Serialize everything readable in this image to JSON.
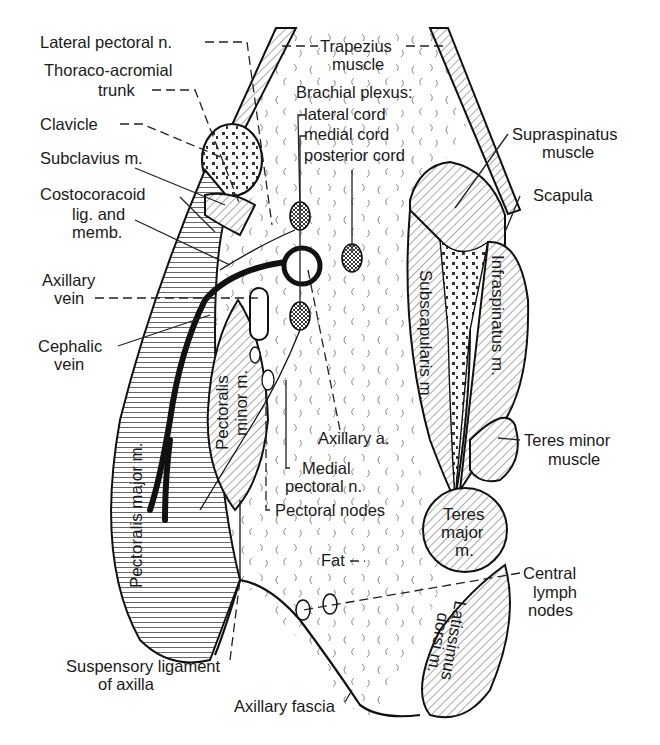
{
  "figure": {
    "left_labels": {
      "lateral_pectoral_n": "Lateral pectoral n.",
      "thoraco_acromial_1": "Thoraco-acromial",
      "thoraco_acromial_2": "trunk",
      "clavicle": "Clavicle",
      "subclavius": "Subclavius m.",
      "costocoracoid_1": "Costocoracoid",
      "costocoracoid_2": "lig. and",
      "costocoracoid_3": "memb.",
      "axillary_vein_1": "Axillary",
      "axillary_vein_2": "vein",
      "cephalic_vein_1": "Cephalic",
      "cephalic_vein_2": "vein"
    },
    "top_labels": {
      "trapezius_1": "Trapezius",
      "trapezius_2": "muscle",
      "brachial_plexus": "Brachial plexus:",
      "lateral_cord": "lateral cord",
      "medial_cord": "medial cord",
      "posterior_cord": "posterior cord"
    },
    "right_labels": {
      "supraspinatus_1": "Supraspinatus",
      "supraspinatus_2": "muscle",
      "scapula": "Scapula",
      "teres_minor_1": "Teres minor",
      "teres_minor_2": "muscle",
      "central_lymph_1": "Central",
      "central_lymph_2": "lymph",
      "central_lymph_3": "nodes"
    },
    "center_labels": {
      "axillary_a": "Axillary a.",
      "medial_pectoral_1": "Medial",
      "medial_pectoral_2": "pectoral n.",
      "pectoral_nodes": "Pectoral nodes",
      "fat": "Fat"
    },
    "bottom_labels": {
      "suspensory_1": "Suspensory ligament",
      "suspensory_2": "of axilla",
      "axillary_fascia": "Axillary fascia"
    },
    "inside_labels": {
      "pectoralis_major": "Pectoralis major m.",
      "pectoralis_minor_1": "Pectoralis",
      "pectoralis_minor_2": "minor m.",
      "subscapularis": "Subscapularis m.",
      "infraspinatus": "Infraspinatus m.",
      "teres_major_1": "Teres",
      "teres_major_2": "major",
      "teres_major_3": "m.",
      "latissimus_1": "Latissimus",
      "latissimus_2": "dorsi m."
    }
  }
}
